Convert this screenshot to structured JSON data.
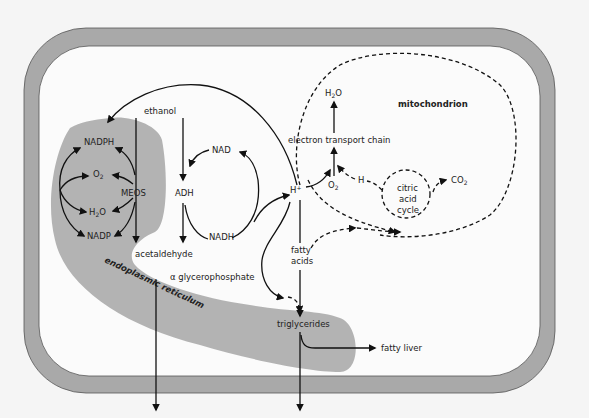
{
  "diagram": {
    "colors": {
      "background": "#f5f5f5",
      "cell_membrane": "#a9a9a9",
      "cell_interior": "#fbfbfb",
      "endoplasmic_reticulum": "#b3b3b3",
      "lines": "#111111"
    },
    "compartments": {
      "er_line1": "endoplasmic",
      "er_line2": "reticulum",
      "mitochondrion": "mitochondrion"
    },
    "labels": {
      "ethanol": "ethanol",
      "nadph": "NADPH",
      "o2_left": "O",
      "o2_left_sub": "2",
      "meos": "MEOS",
      "h2o_left_a": "H",
      "h2o_left_sub": "2",
      "h2o_left_b": "O",
      "nadp": "NADP",
      "acetaldehyde": "acetaldehyde",
      "adh": "ADH",
      "nad": "NAD",
      "nadh": "NADH",
      "glycerophosphate": "α glycerophosphate",
      "h_plus": "H",
      "h_plus_sup": "+",
      "fatty_acids_1": "fatty",
      "fatty_acids_2": "acids",
      "triglycerides": "triglycerides",
      "fatty_liver": "fatty liver",
      "acetate": "acetate",
      "hyperlipidemia": "hyperlipidemia",
      "h2o_top_a": "H",
      "h2o_top_sub": "2",
      "h2o_top_b": "O",
      "etc": "electron transport chain",
      "o2_mito": "O",
      "o2_mito_sub": "2",
      "h": "H",
      "cac_1": "citric",
      "cac_2": "acid",
      "cac_3": "cycle",
      "co2": "CO",
      "co2_sub": "2"
    }
  }
}
